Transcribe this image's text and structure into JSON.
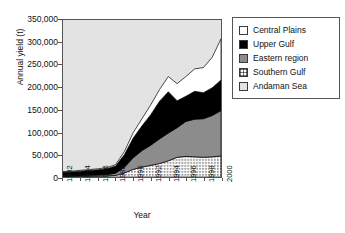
{
  "chart_data": {
    "type": "area",
    "title": "",
    "xlabel": "Year",
    "ylabel": "Annual yield (t)",
    "stacked": true,
    "grid": false,
    "legend_position": "right",
    "ylim": [
      0,
      350000
    ],
    "ytick_labels": [
      "350,000",
      "300,000",
      "250,000",
      "200,000",
      "150,000",
      "100,000",
      "50,000",
      "0"
    ],
    "ytick_values": [
      350000,
      300000,
      250000,
      200000,
      150000,
      100000,
      50000,
      0
    ],
    "xtick_labels": [
      "1982",
      "1984",
      "1986",
      "1988",
      "1990",
      "1992",
      "1994",
      "1996",
      "1998",
      "2000"
    ],
    "x": [
      1982,
      1983,
      1984,
      1985,
      1986,
      1987,
      1988,
      1989,
      1990,
      1991,
      1992,
      1993,
      1994,
      1995,
      1996,
      1997,
      1998,
      1999,
      2000
    ],
    "series": [
      {
        "name": "Andaman Sea",
        "color": "#e3e3e3",
        "swatch": "solid",
        "values": [
          0,
          0,
          0,
          0,
          0,
          0,
          0,
          0,
          0,
          0,
          0,
          0,
          0,
          0,
          0,
          0,
          0,
          0,
          0
        ]
      },
      {
        "name": "Southern Gulf",
        "color": "#ffffff",
        "swatch": "dotted",
        "values": [
          1000,
          1200,
          1500,
          1800,
          2000,
          2500,
          3500,
          9000,
          17000,
          22000,
          26000,
          30000,
          36000,
          44000,
          46000,
          45000,
          44000,
          45000,
          47000
        ]
      },
      {
        "name": "Eastern region",
        "color": "#8c8c8c",
        "swatch": "solid",
        "values": [
          1500,
          1700,
          2000,
          2300,
          2600,
          3000,
          5000,
          13000,
          26000,
          37000,
          45000,
          55000,
          62000,
          66000,
          78000,
          84000,
          86000,
          92000,
          101000
        ]
      },
      {
        "name": "Upper Gulf",
        "color": "#000000",
        "swatch": "solid",
        "values": [
          8000,
          8500,
          9500,
          10500,
          11500,
          13000,
          16000,
          28000,
          44000,
          55000,
          68000,
          84000,
          92000,
          60000,
          56000,
          62000,
          58000,
          62000,
          68000
        ]
      },
      {
        "name": "Central Plains",
        "color": "#ffffff",
        "swatch": "solid",
        "values": [
          1500,
          1600,
          1800,
          2000,
          2200,
          2500,
          3000,
          7000,
          12000,
          16000,
          22000,
          26000,
          34000,
          38000,
          44000,
          50000,
          56000,
          68000,
          92000
        ]
      }
    ],
    "totals": [
      12000,
      13000,
      14800,
      16600,
      18300,
      21000,
      27500,
      57000,
      99000,
      130000,
      161000,
      195000,
      224000,
      208000,
      224000,
      241000,
      244000,
      267000,
      308000
    ]
  },
  "legend": {
    "items": [
      {
        "label": "Central Plains"
      },
      {
        "label": "Upper Gulf"
      },
      {
        "label": "Eastern region"
      },
      {
        "label": "Southern Gulf"
      },
      {
        "label": "Andaman Sea"
      }
    ]
  }
}
